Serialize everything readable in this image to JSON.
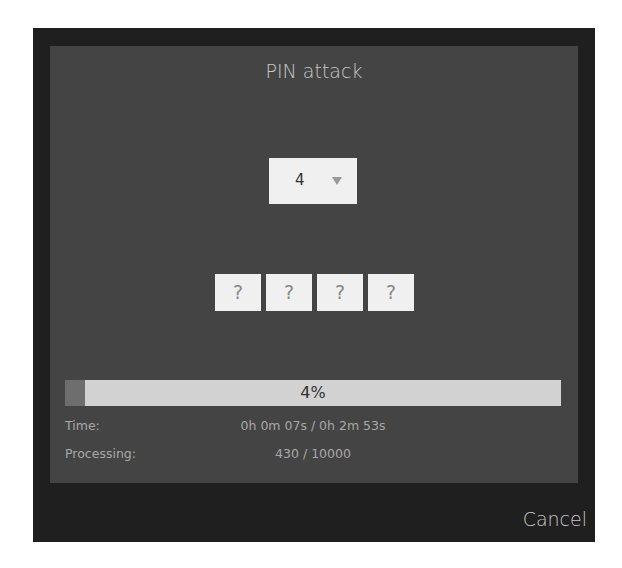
{
  "dialog": {
    "title": "PIN attack",
    "pin_length_select": {
      "selected": "4"
    },
    "pin_digits": [
      "?",
      "?",
      "?",
      "?"
    ],
    "progress": {
      "percent": 4,
      "label": "4%"
    },
    "time": {
      "label": "Time:",
      "value": "0h 0m 07s / 0h 2m 53s"
    },
    "processing": {
      "label": "Processing:",
      "value": "430 / 10000"
    },
    "cancel_label": "Cancel"
  },
  "colors": {
    "frame": "#1f1f1f",
    "panel": "#444444",
    "progress_track": "#d2d2d2",
    "progress_fill": "#6e6e6e"
  }
}
